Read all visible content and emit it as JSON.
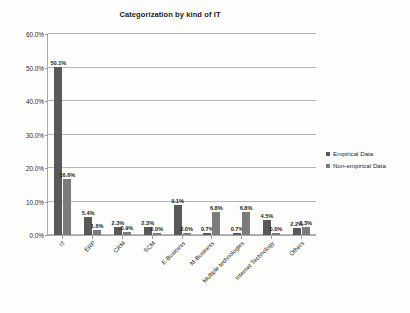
{
  "chart_data": {
    "type": "bar",
    "title": "Categorization by kind of IT",
    "xlabel": "",
    "ylabel": "",
    "ylim": [
      0,
      60
    ],
    "ytick_labels": [
      "0.0%",
      "10.0%",
      "20.0%",
      "30.0%",
      "40.0%",
      "50.0%",
      "60.0%"
    ],
    "ytick_values": [
      0,
      10,
      20,
      30,
      40,
      50,
      60
    ],
    "grid": true,
    "legend_position": "right",
    "categories": [
      "IT",
      "ERP",
      "CRM",
      "SCM",
      "E-Business",
      "M-Business",
      "Multiple technologies",
      "Internet Technology",
      "Others"
    ],
    "series": [
      {
        "name": "Empirical Data",
        "color": "#595959",
        "values": [
          50.1,
          5.4,
          2.3,
          2.3,
          9.1,
          0.7,
          0.7,
          4.5,
          2.2
        ],
        "labels": [
          "50.1%",
          "5.4%",
          "2.3%",
          "2.3%",
          "9.1%",
          "0.7%",
          "0.7%",
          "4.5%",
          "2.2%"
        ]
      },
      {
        "name": "Non-empirical Data",
        "color": "#7c7c7c",
        "values": [
          16.6,
          1.6,
          0.9,
          0.0,
          0.0,
          6.8,
          6.8,
          0.0,
          2.3
        ],
        "labels": [
          "16.6%",
          "1.6%",
          "0.9%",
          "0.0%",
          "0.0%",
          "6.8%",
          "6.8%",
          "0.0%",
          "2.3%"
        ]
      }
    ]
  }
}
